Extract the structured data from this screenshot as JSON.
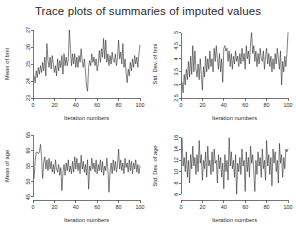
{
  "figure": {
    "title": "Trace plots of summaries of imputed values",
    "background_color": "#ffffff",
    "line_color": "#2b2b2b",
    "axis_color": "#3a3a3a",
    "panel_layout": "2x2"
  },
  "chart_data": [
    {
      "type": "line",
      "panel": "top-left",
      "title": "",
      "xlabel": "Iteration numbers",
      "ylabel": "Mean of bmi",
      "xlim": [
        0,
        100
      ],
      "ylim": [
        23,
        27
      ],
      "xticks": [
        0,
        20,
        40,
        60,
        80,
        100
      ],
      "yticks": [
        23,
        24,
        25,
        26,
        27
      ],
      "grid": false,
      "legend": "none",
      "x": [
        1,
        2,
        3,
        4,
        5,
        6,
        7,
        8,
        9,
        10,
        11,
        12,
        13,
        14,
        15,
        16,
        17,
        18,
        19,
        20,
        21,
        22,
        23,
        24,
        25,
        26,
        27,
        28,
        29,
        30,
        31,
        32,
        33,
        34,
        35,
        36,
        37,
        38,
        39,
        40,
        41,
        42,
        43,
        44,
        45,
        46,
        47,
        48,
        49,
        50,
        51,
        52,
        53,
        54,
        55,
        56,
        57,
        58,
        59,
        60,
        61,
        62,
        63,
        64,
        65,
        66,
        67,
        68,
        69,
        70,
        71,
        72,
        73,
        74,
        75,
        76,
        77,
        78,
        79,
        80,
        81,
        82,
        83,
        84,
        85,
        86,
        87,
        88,
        89,
        90,
        91,
        92,
        93,
        94,
        95,
        96,
        97,
        98,
        99,
        100
      ],
      "values": [
        24.3,
        23.9,
        24.6,
        24.2,
        24.8,
        24.4,
        24.9,
        24.5,
        25.1,
        24.6,
        25.4,
        24.3,
        26.2,
        25.2,
        24.8,
        25.4,
        24.7,
        25.5,
        25.0,
        24.5,
        24.9,
        24.3,
        25.3,
        24.6,
        25.2,
        24.8,
        25.5,
        24.4,
        25.6,
        24.9,
        25.4,
        24.9,
        25.3,
        27.0,
        25.9,
        24.9,
        25.6,
        25.0,
        25.6,
        24.8,
        25.4,
        24.8,
        25.5,
        25.1,
        25.9,
        25.2,
        24.8,
        25.3,
        24.6,
        23.7,
        23.4,
        24.8,
        25.2,
        24.9,
        25.6,
        25.1,
        25.4,
        24.9,
        25.3,
        24.6,
        25.0,
        25.8,
        25.1,
        25.9,
        25.4,
        26.5,
        25.3,
        26.4,
        25.1,
        25.6,
        24.9,
        25.5,
        25.0,
        25.7,
        25.2,
        25.1,
        25.6,
        24.9,
        25.4,
        26.4,
        25.3,
        25.7,
        25.0,
        26.2,
        24.8,
        25.3,
        24.5,
        23.9,
        24.7,
        24.3,
        25.1,
        24.6,
        25.3,
        24.8,
        25.5,
        25.0,
        25.4,
        24.8,
        25.6,
        26.1
      ]
    },
    {
      "type": "line",
      "panel": "top-right",
      "title": "",
      "xlabel": "Iteration numbers",
      "ylabel": "Std. Dev. of bmi",
      "xlim": [
        0,
        100
      ],
      "ylim": [
        2.5,
        5.1
      ],
      "xticks": [
        0,
        20,
        40,
        60,
        80,
        100
      ],
      "yticks": [
        2.5,
        3,
        3.5,
        4,
        4.5,
        5
      ],
      "ytick_labels": [
        "2.5",
        "3",
        "3.5",
        "4",
        "4.5",
        "5"
      ],
      "grid": false,
      "legend": "none",
      "x": [
        1,
        2,
        3,
        4,
        5,
        6,
        7,
        8,
        9,
        10,
        11,
        12,
        13,
        14,
        15,
        16,
        17,
        18,
        19,
        20,
        21,
        22,
        23,
        24,
        25,
        26,
        27,
        28,
        29,
        30,
        31,
        32,
        33,
        34,
        35,
        36,
        37,
        38,
        39,
        40,
        41,
        42,
        43,
        44,
        45,
        46,
        47,
        48,
        49,
        50,
        51,
        52,
        53,
        54,
        55,
        56,
        57,
        58,
        59,
        60,
        61,
        62,
        63,
        64,
        65,
        66,
        67,
        68,
        69,
        70,
        71,
        72,
        73,
        74,
        75,
        76,
        77,
        78,
        79,
        80,
        81,
        82,
        83,
        84,
        85,
        86,
        87,
        88,
        89,
        90,
        91,
        92,
        93,
        94,
        95,
        96,
        97,
        98,
        99,
        100
      ],
      "values": [
        3.1,
        2.7,
        3.4,
        3.0,
        3.6,
        3.2,
        3.9,
        3.3,
        4.1,
        3.4,
        4.5,
        3.5,
        4.3,
        3.6,
        3.3,
        3.8,
        3.2,
        4.0,
        3.4,
        2.8,
        3.7,
        3.3,
        4.1,
        3.5,
        4.0,
        3.6,
        4.3,
        3.7,
        4.0,
        3.5,
        4.4,
        3.9,
        4.5,
        4.0,
        3.6,
        4.2,
        3.5,
        4.0,
        3.1,
        4.4,
        4.5,
        4.3,
        4.4,
        3.9,
        4.3,
        3.7,
        4.2,
        3.6,
        4.1,
        3.8,
        4.3,
        3.9,
        4.1,
        3.7,
        4.2,
        3.8,
        4.4,
        3.9,
        4.2,
        3.6,
        4.5,
        4.0,
        4.3,
        3.8,
        4.6,
        5.0,
        4.2,
        4.5,
        3.9,
        4.3,
        3.7,
        4.2,
        3.8,
        4.4,
        4.0,
        3.9,
        4.3,
        3.6,
        4.1,
        4.4,
        3.8,
        4.2,
        3.7,
        4.1,
        3.5,
        4.0,
        3.6,
        4.2,
        3.8,
        4.4,
        4.0,
        3.6,
        4.3,
        3.0,
        3.9,
        3.5,
        4.1,
        3.7,
        4.2,
        5.0
      ]
    },
    {
      "type": "line",
      "panel": "bottom-left",
      "title": "",
      "xlabel": "Iteration numbers",
      "ylabel": "Mean of age",
      "xlim": [
        0,
        100
      ],
      "ylim": [
        44,
        66
      ],
      "xticks": [
        0,
        20,
        40,
        60,
        80,
        100
      ],
      "yticks": [
        45,
        50,
        55,
        60,
        65
      ],
      "grid": false,
      "legend": "none",
      "x": [
        1,
        2,
        3,
        4,
        5,
        6,
        7,
        8,
        9,
        10,
        11,
        12,
        13,
        14,
        15,
        16,
        17,
        18,
        19,
        20,
        21,
        22,
        23,
        24,
        25,
        26,
        27,
        28,
        29,
        30,
        31,
        32,
        33,
        34,
        35,
        36,
        37,
        38,
        39,
        40,
        41,
        42,
        43,
        44,
        45,
        46,
        47,
        48,
        49,
        50,
        51,
        52,
        53,
        54,
        55,
        56,
        57,
        58,
        59,
        60,
        61,
        62,
        63,
        64,
        65,
        66,
        67,
        68,
        69,
        70,
        71,
        72,
        73,
        74,
        75,
        76,
        77,
        78,
        79,
        80,
        81,
        82,
        83,
        84,
        85,
        86,
        87,
        88,
        89,
        90,
        91,
        92,
        93,
        94,
        95,
        96,
        97,
        98,
        99,
        100
      ],
      "values": [
        51.0,
        56.5,
        59.5,
        59.5,
        59.0,
        59.5,
        62.0,
        58.0,
        51.0,
        56.0,
        58.0,
        54.0,
        57.0,
        53.5,
        57.5,
        54.0,
        56.5,
        53.0,
        55.5,
        52.5,
        57.0,
        54.0,
        53.0,
        55.5,
        52.0,
        54.5,
        47.0,
        53.0,
        55.5,
        52.0,
        56.0,
        53.5,
        57.0,
        53.0,
        55.0,
        52.5,
        56.5,
        53.0,
        58.0,
        54.0,
        57.5,
        53.5,
        56.0,
        52.5,
        58.5,
        54.0,
        56.5,
        53.0,
        55.5,
        52.0,
        57.0,
        47.5,
        55.0,
        53.5,
        57.5,
        54.0,
        56.0,
        53.0,
        57.0,
        52.5,
        55.5,
        53.5,
        57.0,
        53.0,
        56.5,
        52.0,
        55.0,
        53.5,
        57.5,
        54.0,
        46.5,
        53.0,
        56.0,
        52.5,
        57.0,
        53.5,
        56.5,
        53.0,
        55.5,
        60.5,
        54.0,
        57.0,
        53.5,
        56.0,
        52.5,
        57.5,
        54.5,
        56.0,
        53.0,
        57.0,
        53.5,
        56.5,
        52.5,
        56.0,
        54.0,
        57.0,
        53.0,
        55.5,
        52.5,
        55.0
      ]
    },
    {
      "type": "line",
      "panel": "bottom-right",
      "title": "",
      "xlabel": "Iteration numbers",
      "ylabel": "Std. Dev. of age",
      "xlim": [
        0,
        100
      ],
      "ylim": [
        5,
        17
      ],
      "xticks": [
        0,
        20,
        40,
        60,
        80,
        100
      ],
      "yticks": [
        6,
        8,
        10,
        12,
        14,
        16
      ],
      "grid": false,
      "legend": "none",
      "x": [
        1,
        2,
        3,
        4,
        5,
        6,
        7,
        8,
        9,
        10,
        11,
        12,
        13,
        14,
        15,
        16,
        17,
        18,
        19,
        20,
        21,
        22,
        23,
        24,
        25,
        26,
        27,
        28,
        29,
        30,
        31,
        32,
        33,
        34,
        35,
        36,
        37,
        38,
        39,
        40,
        41,
        42,
        43,
        44,
        45,
        46,
        47,
        48,
        49,
        50,
        51,
        52,
        53,
        54,
        55,
        56,
        57,
        58,
        59,
        60,
        61,
        62,
        63,
        64,
        65,
        66,
        67,
        68,
        69,
        70,
        71,
        72,
        73,
        74,
        75,
        76,
        77,
        78,
        79,
        80,
        81,
        82,
        83,
        84,
        85,
        86,
        87,
        88,
        89,
        90,
        91,
        92,
        93,
        94,
        95,
        96,
        97,
        98,
        99,
        100
      ],
      "values": [
        16.0,
        11.0,
        12.5,
        10.0,
        13.5,
        9.0,
        12.0,
        8.0,
        13.0,
        10.5,
        14.5,
        11.0,
        12.5,
        9.5,
        13.0,
        10.0,
        15.5,
        11.5,
        13.0,
        8.5,
        12.0,
        10.5,
        13.5,
        9.0,
        14.5,
        11.0,
        12.0,
        9.5,
        13.5,
        10.0,
        14.0,
        11.5,
        12.0,
        8.0,
        13.0,
        10.5,
        12.5,
        9.0,
        11.5,
        7.0,
        13.0,
        10.0,
        12.0,
        8.5,
        16.0,
        11.0,
        13.5,
        10.5,
        12.0,
        9.0,
        13.0,
        6.0,
        11.5,
        10.0,
        12.5,
        9.5,
        14.0,
        11.0,
        12.0,
        6.5,
        13.5,
        10.0,
        12.5,
        9.0,
        14.5,
        11.5,
        13.0,
        10.0,
        6.5,
        12.0,
        9.5,
        13.5,
        11.0,
        12.5,
        9.0,
        14.0,
        10.5,
        12.0,
        8.5,
        15.5,
        11.0,
        13.0,
        9.5,
        12.5,
        7.5,
        14.0,
        11.5,
        13.5,
        10.0,
        12.0,
        8.0,
        15.0,
        11.5,
        13.0,
        9.0,
        12.5,
        10.5,
        14.0,
        13.5,
        14.0
      ]
    }
  ]
}
